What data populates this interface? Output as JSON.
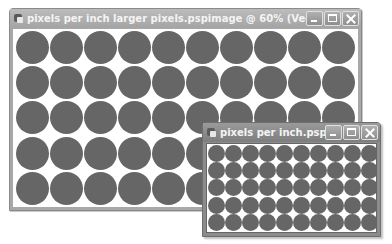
{
  "windows": {
    "large": {
      "title": "pixels per inch larger pixels.pspimage @  60% (Vector 2)",
      "icon": "paint-shop-pro-document-icon",
      "controls": [
        "minimize",
        "maximize",
        "close"
      ],
      "grid": {
        "columns": 10,
        "rows": 5
      },
      "dot_color": "#666666"
    },
    "small": {
      "title": "pixels per inch.pspim...",
      "icon": "paint-shop-pro-document-icon",
      "controls": [
        "minimize",
        "maximize",
        "close"
      ],
      "grid": {
        "columns": 10,
        "rows": 5
      },
      "dot_color": "#666666"
    }
  }
}
